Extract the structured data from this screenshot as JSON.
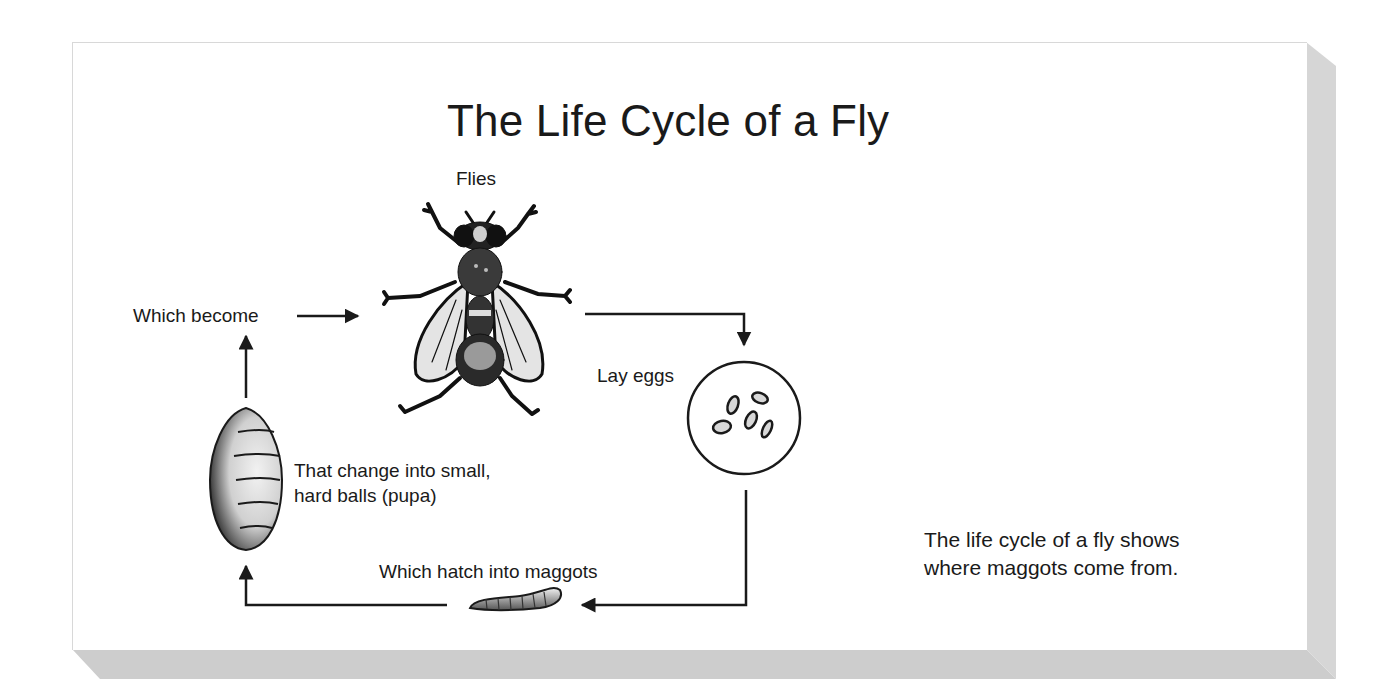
{
  "title": "The Life Cycle of a Fly",
  "stages": {
    "flies": {
      "label": "Flies",
      "icon": "fly-icon"
    },
    "eggs": {
      "label": "Lay eggs",
      "icon": "eggs-icon"
    },
    "maggots": {
      "label": "Which hatch into maggots",
      "icon": "maggot-icon"
    },
    "pupa": {
      "label_line1": "That change into small,",
      "label_line2": "hard balls (pupa)",
      "icon": "pupa-icon"
    },
    "become": {
      "label": "Which become"
    }
  },
  "caption": {
    "line1": "The life cycle of a fly shows",
    "line2": "where maggots come from."
  },
  "colors": {
    "ink": "#1a1a1a",
    "paper": "#ffffff",
    "shadow": "#cfcfcf"
  }
}
